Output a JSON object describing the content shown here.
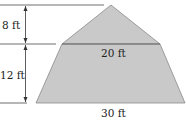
{
  "diagram": {
    "labels": {
      "triangle_height": "8 ft",
      "trapezoid_height": "12 ft",
      "trapezoid_top_width": "20 ft",
      "trapezoid_bottom_width": "30 ft"
    },
    "colors": {
      "fill": "#c9c9c9",
      "stroke": "#6e6e6e",
      "text": "#222222"
    }
  }
}
